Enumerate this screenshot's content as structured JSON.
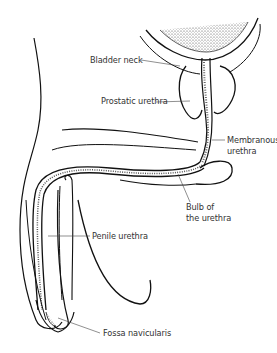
{
  "diagram": {
    "colors": {
      "line": "#111111",
      "label_text": "#333333",
      "leader": "#444444",
      "background": "#ffffff"
    },
    "labels": {
      "bladder_neck": "Bladder neck",
      "prostatic_urethra": "Prostatic urethra",
      "membranous_urethra_1": "Membranous",
      "membranous_urethra_2": "urethra",
      "bulb_1": "Bulb of",
      "bulb_2": "the urethra",
      "penile_urethra": "Penile urethra",
      "fossa_navicularis": "Fossa navicularis"
    }
  }
}
